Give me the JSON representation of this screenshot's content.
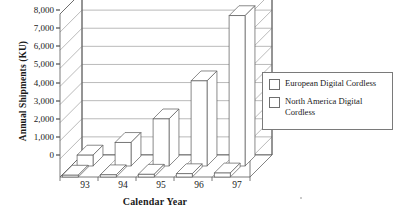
{
  "chart_data": {
    "type": "bar",
    "title": "",
    "subtitle": "",
    "xlabel": "Calendar Year",
    "ylabel": "Annual Shipments (KU)",
    "categories": [
      "93",
      "94",
      "95",
      "96",
      "97"
    ],
    "ylim": [
      0,
      9000
    ],
    "ytick_values": [
      0,
      1000,
      2000,
      3000,
      4000,
      5000,
      6000,
      7000,
      8000,
      9000
    ],
    "ytick_labels": [
      "0",
      "1,000",
      "2,000",
      "3,000",
      "4,000",
      "5,000",
      "6,000",
      "7,000",
      "8,000",
      "9,000"
    ],
    "grid": true,
    "legend_position": "right",
    "projection": "3d",
    "series": [
      {
        "name": "European Digital Cordless",
        "values": [
          600,
          1300,
          2600,
          4700,
          8300
        ],
        "color": "#ffffff",
        "edge_color": "#4a4a4a",
        "row": "back"
      },
      {
        "name": "North America Digital Cordless",
        "values": [
          100,
          120,
          150,
          180,
          220
        ],
        "color": "#ffffff",
        "edge_color": "#4a4a4a",
        "row": "front"
      }
    ]
  },
  "axes": {
    "y": {
      "title": "Annual Shipments (KU)",
      "ticks": [
        "9,000",
        "8,000",
        "7,000",
        "6,000",
        "5,000",
        "4,000",
        "3,000",
        "2,000",
        "1,000",
        "0"
      ]
    },
    "x": {
      "title": "Calendar Year",
      "ticks": [
        "93",
        "94",
        "95",
        "96",
        "97"
      ]
    }
  },
  "legend": {
    "items": [
      {
        "label": "European Digital Cordless"
      },
      {
        "label": "North America Digital\nCordless"
      }
    ]
  }
}
